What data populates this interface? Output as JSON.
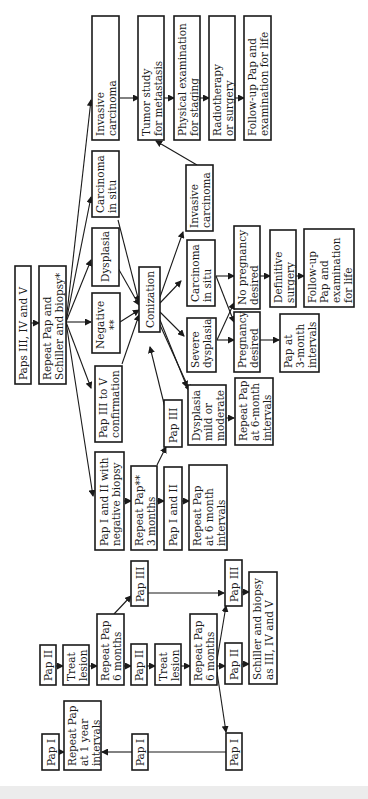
{
  "diagram": {
    "orientation": "rotated-90-ccw",
    "nodes": {
      "paps_3_4_5": [
        "Paps III, IV and V"
      ],
      "repeat_pap_schiller": [
        "Repeat Pap and",
        "Schiller and biopsy*"
      ],
      "pap_1_2_neg_biopsy": [
        "Pap I and II with",
        "negative biopsy"
      ],
      "pap_3_to_5_confirm": [
        "Pap III to V",
        "confirmation"
      ],
      "negative": [
        "Negative",
        "**"
      ],
      "dysplasia": [
        "Dysplasia"
      ],
      "carcinoma_in_situ_top": [
        "Carcinoma",
        "in situ"
      ],
      "invasive_carcinoma_top": [
        "Invasive",
        "carcinoma"
      ],
      "repeat_pap_3_months": [
        "Repeat Pap**",
        "3 months"
      ],
      "pap_3_mid": [
        "Pap III"
      ],
      "pap_1_2_mid": [
        "Pap I and II"
      ],
      "conization": [
        "Conization"
      ],
      "repeat_pap_6_month_intervals": [
        "Repeat Pap",
        "at 6 month",
        "intervals"
      ],
      "dysplasia_mild": [
        "Dysplasia",
        "mild or",
        "moderate"
      ],
      "severe_dysplasia": [
        "Severe",
        "dysplasia"
      ],
      "carcinoma_in_situ_mid": [
        "Carcinoma",
        "in situ"
      ],
      "invasive_carcinoma_mid": [
        "Invasive",
        "carcinoma"
      ],
      "repeat_pap_6_month_intervals_2": [
        "Repeat Pap",
        "at 6-month",
        "intervals"
      ],
      "pregnancy_desired": [
        "Pregnancy",
        "desired"
      ],
      "no_pregnancy_desired": [
        "No pregnancy",
        "desired"
      ],
      "pap_3_month_intervals": [
        "Pap at",
        "3-month",
        "intervals"
      ],
      "definitive_surgery": [
        "Definitive",
        "surgery"
      ],
      "followup_life_mid": [
        "Follow-up",
        "Pap and",
        "examination",
        "for life"
      ],
      "tumor_study": [
        "Tumor study",
        "for metastasis"
      ],
      "physical_exam": [
        "Physical examination",
        "for staging"
      ],
      "radiotherapy": [
        "Radiotherapy",
        "or surgery"
      ],
      "followup_life_top": [
        "Follow-up Pap and",
        "examination for life"
      ],
      "pap_1_a": [
        "Pap I"
      ],
      "repeat_pap_1_year": [
        "Repeat Pap",
        "at 1 year",
        "intervals"
      ],
      "pap_1_b": [
        "Pap I"
      ],
      "pap_2_a": [
        "Pap II"
      ],
      "treat_lesion_a": [
        "Treat",
        "lesion"
      ],
      "repeat_pap_6_months_a": [
        "Repeat Pap",
        "6 months"
      ],
      "pap_3_a": [
        "Pap III"
      ],
      "pap_2_b": [
        "Pap II"
      ],
      "treat_lesion_b": [
        "Treat",
        "lesion"
      ],
      "repeat_pap_6_months_b": [
        "Repeat Pap",
        "6 months"
      ],
      "pap_2_c": [
        "Pap II"
      ],
      "pap_3_b": [
        "Pap III"
      ],
      "schiller_biopsy": [
        "Schiller and biopsy",
        "as III, IV and V"
      ]
    }
  }
}
